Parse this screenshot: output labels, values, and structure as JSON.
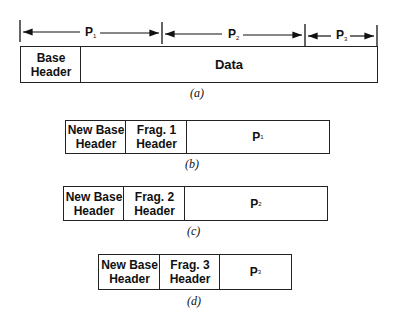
{
  "diagram_a": {
    "dimensions": [
      {
        "label": "P",
        "sub": "1"
      },
      {
        "label": "P",
        "sub": "2"
      },
      {
        "label": "P",
        "sub": "3"
      }
    ],
    "cells": [
      "Base\nHeader",
      "Data"
    ],
    "caption": "(a)"
  },
  "diagram_b": {
    "cells": [
      "New Base\nHeader",
      "Frag. 1\nHeader"
    ],
    "payload": {
      "label": "P",
      "sub": "1"
    },
    "caption": "(b)"
  },
  "diagram_c": {
    "cells": [
      "New Base\nHeader",
      "Frag. 2\nHeader"
    ],
    "payload": {
      "label": "P",
      "sub": "2"
    },
    "caption": "(c)"
  },
  "diagram_d": {
    "cells": [
      "New Base\nHeader",
      "Frag. 3\nHeader"
    ],
    "payload": {
      "label": "P",
      "sub": "3"
    },
    "caption": "(d)"
  }
}
